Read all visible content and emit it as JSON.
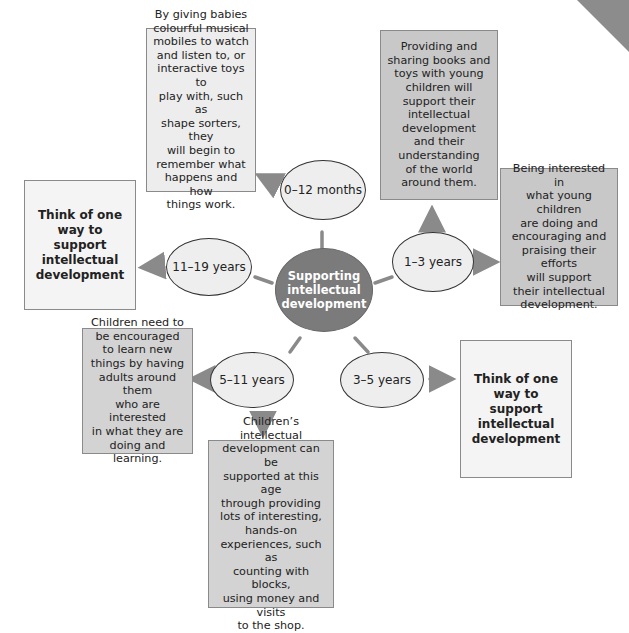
{
  "diagram": {
    "center": {
      "label": "Supporting\nintellectual\ndevelopment",
      "color": "#7b7b7b"
    },
    "age_groups": [
      {
        "id": "0-12m",
        "label": "0–12 months"
      },
      {
        "id": "1-3y",
        "label": "1–3 years"
      },
      {
        "id": "3-5y",
        "label": "3–5 years"
      },
      {
        "id": "5-11y",
        "label": "5–11 years"
      },
      {
        "id": "11-19y",
        "label": "11–19 years"
      }
    ],
    "boxes": {
      "infant": "By giving babies\ncolourful musical\nmobiles to watch\nand listen to, or\ninteractive toys to\nplay with, such as\nshape sorters, they\nwill begin to\nremember what\nhappens and how\nthings work.",
      "toddler_books": "Providing and\nsharing books and\ntoys with young\nchildren will\nsupport their\nintellectual\ndevelopment\nand their\nunderstanding\nof the world\naround them.",
      "toddler_praise": "Being interested in\nwhat young children\nare doing and\nencouraging and\npraising their efforts\nwill support\ntheir intellectual\ndevelopment.",
      "adolescent_prompt": "Think of one\nway to\nsupport\nintellectual\ndevelopment",
      "preschool_prompt": "Think of one\nway to\nsupport\nintellectual\ndevelopment",
      "school_encourage": "Children need to\nbe encouraged\nto learn new\nthings by having\nadults around them\nwho are interested\nin what they are\ndoing and\nlearning.",
      "school_handson": "Children’s intellectual\ndevelopment can be\nsupported at this age\nthrough providing\nlots of interesting,\nhands-on\nexperiences, such as\ncounting with blocks,\nusing money and visits\nto the shop."
    },
    "colors": {
      "arrow": "#8a8a8a",
      "box_border": "#8a8a8a",
      "ellipse_fill": "#eeeeee"
    }
  }
}
